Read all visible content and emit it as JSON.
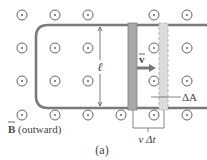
{
  "figure_label": "(a)",
  "field": {
    "symbol": "B",
    "direction_label": "(outward)",
    "marker": "dot-in-circle",
    "grid": {
      "cols_x": [
        22,
        55,
        88,
        121,
        154,
        187
      ],
      "rows_y": [
        15,
        48,
        81,
        115
      ]
    },
    "hidden_cells": [
      [
        3,
        0
      ],
      [
        3,
        1
      ],
      [
        3,
        2
      ],
      [
        4,
        0
      ],
      [
        4,
        1
      ],
      [
        4,
        2
      ]
    ]
  },
  "labels": {
    "length": "ℓ",
    "velocity": "v",
    "delta_area": "ΔA",
    "displacement": "v Δt",
    "b_field": "B",
    "b_field_dir": "(outward)"
  },
  "colors": {
    "rail": "#7a7a7a",
    "rod_fill": "#a9a9a9",
    "rod_ghost_fill": "#dcdcdc",
    "circle": "#666666",
    "text": "#444444"
  }
}
